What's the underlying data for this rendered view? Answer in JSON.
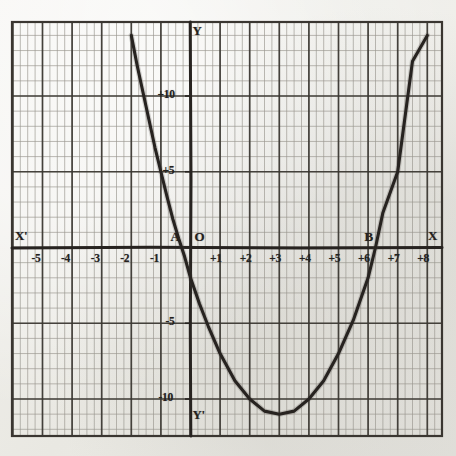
{
  "figure": {
    "kind": "hand-drawn-graph-paper-plot",
    "ink_color": "#272320",
    "grid_minor_color": "#9a968e",
    "grid_major_color": "#3a3631",
    "paper_color": "#edece7"
  },
  "axis_names": {
    "x_positive": "X",
    "x_negative": "X'",
    "y_positive": "Y",
    "y_negative": "Y'",
    "origin": "O"
  },
  "points": [
    {
      "name": "A",
      "label": "A",
      "x": -0.3,
      "y": 0
    },
    {
      "name": "B",
      "label": "B",
      "x": 6.25,
      "y": 0
    }
  ],
  "chart_data": {
    "type": "line",
    "title": "",
    "xlabel": "",
    "ylabel": "",
    "xlim": [
      -6.4,
      8.9
    ],
    "ylim": [
      -15.2,
      14.8
    ],
    "grid": true,
    "grid_minor_step_x": 0.25,
    "grid_minor_step_y": 1,
    "grid_major_step_x": 1,
    "grid_major_step_y": 5,
    "legend": "none",
    "x_tick_labels": [
      "-5",
      "-4",
      "-3",
      "-2",
      "-1",
      "+1",
      "+2",
      "+3",
      "+4",
      "+5",
      "+6",
      "+7",
      "+8"
    ],
    "x_tick_values": [
      -5,
      -4,
      -3,
      -2,
      -1,
      1,
      2,
      3,
      4,
      5,
      6,
      7,
      8
    ],
    "y_tick_labels": [
      "+10",
      "+5",
      "-5",
      "-10"
    ],
    "y_tick_values": [
      10,
      5,
      -5,
      -10
    ],
    "series": [
      {
        "name": "parabola",
        "equation": "y = x^2 - 6x - 2",
        "x": [
          -2.0,
          -1.8,
          -1.6,
          -1.4,
          -1.2,
          -1.0,
          -0.8,
          -0.6,
          -0.4,
          -0.3,
          -0.2,
          0.0,
          0.3,
          0.6,
          1.0,
          1.5,
          2.0,
          2.5,
          3.0,
          3.5,
          4.0,
          4.5,
          5.0,
          5.5,
          6.0,
          6.25,
          6.5,
          7.0,
          7.5,
          8.0
        ],
        "y": [
          14.0,
          12.0,
          10.2,
          8.4,
          6.6,
          5.0,
          3.4,
          1.9,
          0.6,
          0.0,
          -0.6,
          -2.0,
          -3.7,
          -5.2,
          -7.0,
          -8.8,
          -10.0,
          -10.8,
          -11.0,
          -10.8,
          -10.0,
          -8.8,
          -7.0,
          -4.8,
          -2.0,
          0.0,
          2.3,
          5.0,
          12.3,
          14.0
        ]
      }
    ],
    "annotations": [
      {
        "text": "A",
        "x": -0.3,
        "y": 0.55,
        "note": "left x-intercept marker"
      },
      {
        "text": "B",
        "x": 6.25,
        "y": 0.55,
        "note": "right x-intercept marker"
      },
      {
        "text": "O",
        "x": 0.32,
        "y": 0.55,
        "note": "origin marker"
      }
    ]
  }
}
